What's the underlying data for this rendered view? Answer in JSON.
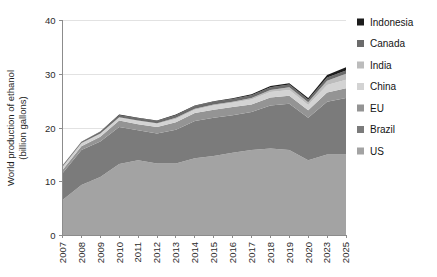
{
  "chart_data": {
    "type": "area",
    "stacked": true,
    "title": "",
    "subtitle": "",
    "xlabel": "",
    "ylabel": "World production of ethanol (billion gallons)",
    "ylabel_line1": "World production of ethanol",
    "ylabel_line2": "(billion gallons)",
    "ylim": [
      0,
      40
    ],
    "yticks": [
      0,
      10,
      20,
      30,
      40
    ],
    "ytick_labels": [
      "0",
      "10",
      "20",
      "30",
      "40"
    ],
    "grid": true,
    "grid_axis": "y",
    "legend_position": "right",
    "categories": [
      "2007",
      "2008",
      "2009",
      "2010",
      "2011",
      "2012",
      "2013",
      "2014",
      "2015",
      "2016",
      "2017",
      "2018",
      "2019",
      "2020",
      "2023",
      "2025"
    ],
    "x": [
      2007,
      2008,
      2009,
      2010,
      2011,
      2012,
      2013,
      2014,
      2015,
      2016,
      2017,
      2018,
      2019,
      2020,
      2023,
      2025
    ],
    "stack_order_bottom_to_top": [
      "US",
      "Brazil",
      "EU",
      "China",
      "India",
      "Canada",
      "Indonesia"
    ],
    "series": [
      {
        "name": "US",
        "color": "#a3a3a3",
        "values": [
          6.5,
          9.3,
          10.8,
          13.2,
          13.9,
          13.3,
          13.3,
          14.3,
          14.7,
          15.3,
          15.8,
          16.1,
          15.8,
          13.9,
          15.0,
          15.0
        ]
      },
      {
        "name": "Brazil",
        "color": "#7b7b7b",
        "values": [
          5.0,
          6.5,
          6.6,
          6.9,
          5.6,
          5.6,
          6.3,
          6.9,
          7.1,
          7.0,
          7.1,
          8.0,
          8.6,
          7.9,
          9.8,
          10.5
        ]
      },
      {
        "name": "EU",
        "color": "#949494",
        "values": [
          0.6,
          0.7,
          0.9,
          1.2,
          1.1,
          1.2,
          1.4,
          1.5,
          1.5,
          1.5,
          1.4,
          1.5,
          1.5,
          1.4,
          1.7,
          1.8
        ]
      },
      {
        "name": "China",
        "color": "#d3d3d3",
        "values": [
          0.5,
          0.5,
          0.5,
          0.5,
          0.6,
          0.6,
          0.6,
          0.6,
          0.8,
          0.8,
          0.9,
          1.0,
          1.1,
          1.0,
          1.4,
          1.6
        ]
      },
      {
        "name": "India",
        "color": "#bcbcbc",
        "values": [
          0.1,
          0.1,
          0.1,
          0.1,
          0.1,
          0.1,
          0.2,
          0.2,
          0.2,
          0.2,
          0.3,
          0.4,
          0.5,
          0.5,
          0.8,
          1.1
        ]
      },
      {
        "name": "Canada",
        "color": "#6b6b6b",
        "values": [
          0.2,
          0.2,
          0.3,
          0.4,
          0.4,
          0.4,
          0.5,
          0.5,
          0.5,
          0.5,
          0.5,
          0.5,
          0.5,
          0.5,
          0.6,
          0.6
        ]
      },
      {
        "name": "Indonesia",
        "color": "#1c1c1c",
        "values": [
          0.05,
          0.05,
          0.05,
          0.1,
          0.1,
          0.1,
          0.1,
          0.1,
          0.1,
          0.15,
          0.2,
          0.2,
          0.25,
          0.3,
          0.45,
          0.6
        ]
      }
    ],
    "totals": [
      12.95,
      17.35,
      19.25,
      22.4,
      21.8,
      21.3,
      22.4,
      24.1,
      24.9,
      25.45,
      26.2,
      27.7,
      28.25,
      25.5,
      29.75,
      31.2
    ]
  },
  "legend": {
    "entries": [
      {
        "label": "Indonesia",
        "color": "#1c1c1c"
      },
      {
        "label": "Canada",
        "color": "#6b6b6b"
      },
      {
        "label": "India",
        "color": "#bcbcbc"
      },
      {
        "label": "China",
        "color": "#d3d3d3"
      },
      {
        "label": "EU",
        "color": "#949494"
      },
      {
        "label": "Brazil",
        "color": "#7b7b7b"
      },
      {
        "label": "US",
        "color": "#a3a3a3"
      }
    ]
  },
  "axes": {
    "y_title_line1": "World production of ethanol",
    "y_title_line2": "(billion gallons)"
  }
}
